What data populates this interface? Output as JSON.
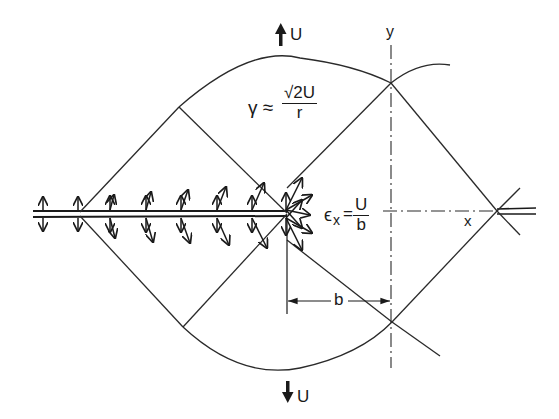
{
  "figure": {
    "type": "mechanics diagram: slip-line field at a crack tip under tension",
    "colors": {
      "ink": "#1a1a1a",
      "background": "#ffffff"
    }
  },
  "labels": {
    "top_velocity": "U",
    "bottom_velocity": "U",
    "y_axis": "y",
    "x_axis": "x",
    "dimension_b": "b",
    "shear_rate": {
      "lhs": "γ ≈",
      "numerator": "√2U",
      "denominator": "r"
    },
    "strain_rate": {
      "lhs": "ϵ",
      "subscript": "x",
      "equals": "=",
      "numerator": "U",
      "denominator": "b"
    }
  },
  "icons": {
    "top_arrow": "arrow-up-icon",
    "bottom_arrow": "arrow-down-icon"
  }
}
